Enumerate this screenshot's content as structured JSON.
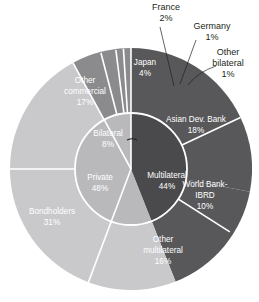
{
  "chart_data": {
    "type": "pie",
    "title": "",
    "subtitle": "",
    "xlabel": "",
    "ylabel": "",
    "legend_position": "none",
    "grid": false,
    "layout": "two-level sunburst donut, clockwise from 12 o'clock",
    "units": "percent of total",
    "rings": [
      {
        "name": "inner",
        "slices": [
          {
            "label": "Multilateral",
            "value": 44,
            "value_text": "44%",
            "color": "#4a4a4c",
            "label_fill": "#ffffff"
          },
          {
            "label": "Private",
            "value": 48,
            "value_text": "48%",
            "color": "#b9b9bb",
            "label_fill": "#ffffff"
          },
          {
            "label": "Bilateral",
            "value": 8,
            "value_text": "8%",
            "color": "#b9b9bb",
            "label_fill": "#ffffff"
          }
        ]
      },
      {
        "name": "outer",
        "slices": [
          {
            "label": "Asian Dev. Bank",
            "value": 18,
            "value_text": "18%",
            "color": "#58585a",
            "label_fill": "#ffffff",
            "parent": "Multilateral",
            "callout": false
          },
          {
            "label": "World Bank-IBRD",
            "value": 10,
            "value_text": "10%",
            "color": "#58585a",
            "label_fill": "#ffffff",
            "parent": "Multilateral",
            "callout": false
          },
          {
            "label": "Other multilateral",
            "value": 16,
            "value_text": "16%",
            "color": "#58585a",
            "label_fill": "#ffffff",
            "parent": "Multilateral",
            "callout": false
          },
          {
            "label": "Bondholders",
            "value": 31,
            "value_text": "31%",
            "color": "#c9c9cb",
            "label_fill": "#ffffff",
            "parent": "Private",
            "callout": false
          },
          {
            "label": "Other commercial",
            "value": 17,
            "value_text": "17%",
            "color": "#c9c9cb",
            "label_fill": "#ffffff",
            "parent": "Private",
            "callout": false
          },
          {
            "label": "Japan",
            "value": 4,
            "value_text": "4%",
            "color": "#8b8b8d",
            "label_fill": "#ffffff",
            "parent": "Bilateral",
            "callout": false
          },
          {
            "label": "France",
            "value": 2,
            "value_text": "2%",
            "color": "#8b8b8d",
            "label_fill": "#231f20",
            "parent": "Bilateral",
            "callout": true
          },
          {
            "label": "Germany",
            "value": 1,
            "value_text": "1%",
            "color": "#8b8b8d",
            "label_fill": "#231f20",
            "parent": "Bilateral",
            "callout": true
          },
          {
            "label": "Other bilateral",
            "value": 1,
            "value_text": "1%",
            "color": "#8b8b8d",
            "label_fill": "#231f20",
            "parent": "Bilateral",
            "callout": true
          }
        ]
      }
    ],
    "inner_labels": {
      "multilateral": {
        "name": "Multilateral",
        "pct": "44%"
      },
      "private": {
        "name": "Private",
        "pct": "48%"
      },
      "bilateral": {
        "name": "Bilateral",
        "pct": "8%"
      }
    },
    "outer_labels": {
      "asian_dev_bank": {
        "line1": "Asian Dev. Bank",
        "pct": "18%"
      },
      "world_bank": {
        "line1": "World Bank-",
        "line2": "IBRD",
        "pct": "10%"
      },
      "other_multilateral": {
        "line1": "Other",
        "line2": "multilateral",
        "pct": "16%"
      },
      "bondholders": {
        "line1": "Bondholders",
        "pct": "31%"
      },
      "other_commercial": {
        "line1": "Other",
        "line2": "commercial",
        "pct": "17%"
      },
      "japan": {
        "line1": "Japan",
        "pct": "4%"
      }
    },
    "callout_labels": {
      "france": {
        "line1": "France",
        "pct": "2%"
      },
      "germany": {
        "line1": "Germany",
        "pct": "1%"
      },
      "other_bilateral": {
        "line1": "Other",
        "line2": "bilateral",
        "pct": "1%"
      }
    },
    "colors": {
      "multilateral_inner": "#4a4a4c",
      "multilateral_outer": "#58585a",
      "private_inner": "#b9b9bb",
      "private_outer": "#c9c9cb",
      "bilateral_outer": "#8b8b8d",
      "separator": "#ffffff",
      "text_dark": "#231f20",
      "text_light": "#ffffff",
      "background": "#ffffff"
    }
  }
}
